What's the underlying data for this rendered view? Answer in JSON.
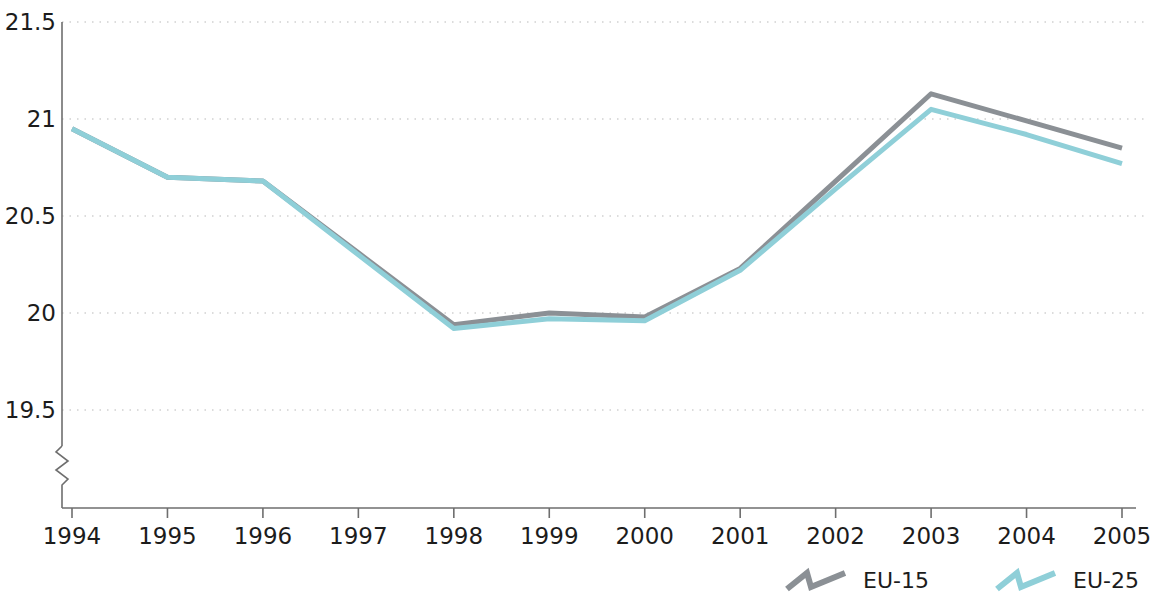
{
  "chart_data": {
    "type": "line",
    "title": "",
    "subtitle": "",
    "xlabel": "",
    "ylabel": "",
    "categories": [
      "1994",
      "1995",
      "1996",
      "1997",
      "1998",
      "1999",
      "2000",
      "2001",
      "2002",
      "2003",
      "2004",
      "2005"
    ],
    "x": [
      1994,
      1995,
      1996,
      1997,
      1998,
      1999,
      2000,
      2001,
      2002,
      2003,
      2004,
      2005
    ],
    "series": [
      {
        "name": "EU-15",
        "color": "#8b9095",
        "values": [
          20.95,
          20.7,
          20.68,
          20.31,
          19.94,
          20.0,
          19.98,
          20.23,
          20.68,
          21.13,
          20.99,
          20.85
        ]
      },
      {
        "name": "EU-25",
        "color": "#8fcfd8",
        "values": [
          20.95,
          20.7,
          20.68,
          20.3,
          19.92,
          19.97,
          19.96,
          20.22,
          20.64,
          21.05,
          20.92,
          20.77
        ]
      }
    ],
    "ylim": [
      19.5,
      21.5
    ],
    "yticks": [
      19.5,
      20,
      20.5,
      21,
      21.5
    ],
    "ytick_labels": [
      "19.5",
      "20",
      "20.5",
      "21",
      "21.5"
    ],
    "xticks": [
      1994,
      1995,
      1996,
      1997,
      1998,
      1999,
      2000,
      2001,
      2002,
      2003,
      2004,
      2005
    ],
    "grid": true,
    "grid_axis": "y",
    "grid_style": "dotted",
    "grid_color": "#b9b9b9",
    "axis_color": "#6e6e6e",
    "axis_break": true,
    "axis_break_note": "zigzag break on y-axis below 19.5",
    "legend_position": "bottom-right",
    "legend": [
      {
        "label": "EU-15",
        "color": "#8b9095",
        "marker": "zigzag-line"
      },
      {
        "label": "EU-25",
        "color": "#8fcfd8",
        "marker": "zigzag-line"
      }
    ]
  },
  "axis": {
    "y_labels": [
      "21.5",
      "21",
      "20.5",
      "20",
      "19.5"
    ],
    "x_labels": [
      "1994",
      "1995",
      "1996",
      "1997",
      "1998",
      "1999",
      "2000",
      "2001",
      "2002",
      "2003",
      "2004",
      "2005"
    ]
  },
  "legend": {
    "items": [
      {
        "label": "EU-15"
      },
      {
        "label": "EU-25"
      }
    ]
  }
}
